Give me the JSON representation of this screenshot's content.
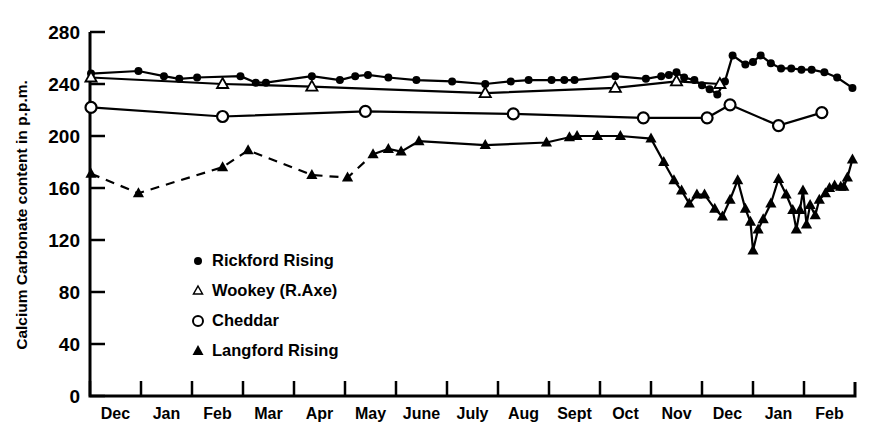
{
  "chart_data": {
    "type": "line",
    "title": "",
    "xlabel": "",
    "ylabel": "Calcium Carbonate content in p.p.m.",
    "ylim": [
      0,
      280
    ],
    "yticks": [
      0,
      40,
      80,
      120,
      160,
      200,
      240,
      280
    ],
    "categories": [
      "Dec",
      "Jan",
      "Feb",
      "Mar",
      "Apr",
      "May",
      "June",
      "July",
      "Aug",
      "Sept",
      "Oct",
      "Nov",
      "Dec",
      "Jan",
      "Feb"
    ],
    "xlim": [
      0,
      15
    ],
    "grid": false,
    "legend_position": "inside-lower-left",
    "series": [
      {
        "name": "Rickford Rising",
        "marker": "filled-circle",
        "line": "solid",
        "points": [
          [
            0.02,
            248
          ],
          [
            0.95,
            250
          ],
          [
            1.45,
            246
          ],
          [
            1.75,
            244
          ],
          [
            2.1,
            245
          ],
          [
            2.95,
            246
          ],
          [
            3.25,
            241
          ],
          [
            3.45,
            241
          ],
          [
            4.35,
            246
          ],
          [
            4.9,
            243
          ],
          [
            5.2,
            246
          ],
          [
            5.45,
            247
          ],
          [
            5.85,
            245
          ],
          [
            6.4,
            243
          ],
          [
            7.1,
            242
          ],
          [
            7.75,
            240
          ],
          [
            8.25,
            242
          ],
          [
            8.6,
            243
          ],
          [
            9.05,
            243
          ],
          [
            9.3,
            243
          ],
          [
            9.5,
            243
          ],
          [
            10.3,
            246
          ],
          [
            10.9,
            244
          ],
          [
            11.2,
            246
          ],
          [
            11.35,
            247
          ],
          [
            11.5,
            249
          ],
          [
            11.65,
            245
          ],
          [
            11.85,
            243
          ],
          [
            12.0,
            239
          ],
          [
            12.15,
            236
          ],
          [
            12.3,
            232
          ],
          [
            12.45,
            242
          ],
          [
            12.6,
            262
          ],
          [
            12.85,
            255
          ],
          [
            13.0,
            257
          ],
          [
            13.15,
            262
          ],
          [
            13.35,
            256
          ],
          [
            13.55,
            252
          ],
          [
            13.75,
            252
          ],
          [
            13.95,
            251
          ],
          [
            14.15,
            251
          ],
          [
            14.4,
            249
          ],
          [
            14.65,
            245
          ],
          [
            14.95,
            237
          ]
        ]
      },
      {
        "name": "Wookey (R.Axe)",
        "marker": "open-triangle",
        "line": "solid",
        "points": [
          [
            0.02,
            245
          ],
          [
            2.6,
            240
          ],
          [
            4.35,
            238
          ],
          [
            7.75,
            233
          ],
          [
            10.3,
            237
          ],
          [
            11.5,
            242
          ],
          [
            12.35,
            240
          ]
        ]
      },
      {
        "name": "Cheddar",
        "marker": "open-circle",
        "line": "solid",
        "points": [
          [
            0.02,
            222
          ],
          [
            2.6,
            215
          ],
          [
            5.4,
            219
          ],
          [
            8.3,
            217
          ],
          [
            10.85,
            214
          ],
          [
            12.1,
            214
          ],
          [
            12.55,
            224
          ],
          [
            13.5,
            208
          ],
          [
            14.35,
            218
          ]
        ]
      },
      {
        "name": "Langford Rising",
        "marker": "filled-triangle",
        "line": "dashed-then-solid",
        "dash_until_index": 6,
        "points": [
          [
            0.02,
            171
          ],
          [
            0.95,
            156
          ],
          [
            2.6,
            176
          ],
          [
            3.1,
            189
          ],
          [
            4.35,
            170
          ],
          [
            5.05,
            168
          ],
          [
            5.55,
            186
          ],
          [
            5.85,
            190
          ],
          [
            6.1,
            188
          ],
          [
            6.45,
            196
          ],
          [
            7.75,
            193
          ],
          [
            8.95,
            195
          ],
          [
            9.4,
            199
          ],
          [
            9.55,
            200
          ],
          [
            9.95,
            200
          ],
          [
            10.4,
            200
          ],
          [
            11.0,
            198
          ],
          [
            11.25,
            180
          ],
          [
            11.45,
            166
          ],
          [
            11.6,
            158
          ],
          [
            11.75,
            148
          ],
          [
            11.9,
            155
          ],
          [
            12.05,
            155
          ],
          [
            12.25,
            144
          ],
          [
            12.4,
            138
          ],
          [
            12.55,
            151
          ],
          [
            12.7,
            166
          ],
          [
            12.85,
            144
          ],
          [
            12.95,
            134
          ],
          [
            13.0,
            112
          ],
          [
            13.1,
            128
          ],
          [
            13.2,
            136
          ],
          [
            13.35,
            148
          ],
          [
            13.5,
            167
          ],
          [
            13.65,
            155
          ],
          [
            13.78,
            143
          ],
          [
            13.85,
            128
          ],
          [
            13.92,
            143
          ],
          [
            13.98,
            158
          ],
          [
            14.05,
            132
          ],
          [
            14.12,
            147
          ],
          [
            14.22,
            139
          ],
          [
            14.3,
            151
          ],
          [
            14.42,
            156
          ],
          [
            14.5,
            160
          ],
          [
            14.6,
            162
          ],
          [
            14.72,
            161
          ],
          [
            14.78,
            161
          ],
          [
            14.85,
            168
          ],
          [
            14.95,
            182
          ]
        ]
      }
    ]
  },
  "legend": {
    "items": [
      {
        "label": "Rickford Rising",
        "marker": "filled-circle"
      },
      {
        "label": "Wookey (R.Axe)",
        "marker": "open-triangle"
      },
      {
        "label": "Cheddar",
        "marker": "open-circle"
      },
      {
        "label": "Langford Rising",
        "marker": "filled-triangle"
      }
    ]
  }
}
